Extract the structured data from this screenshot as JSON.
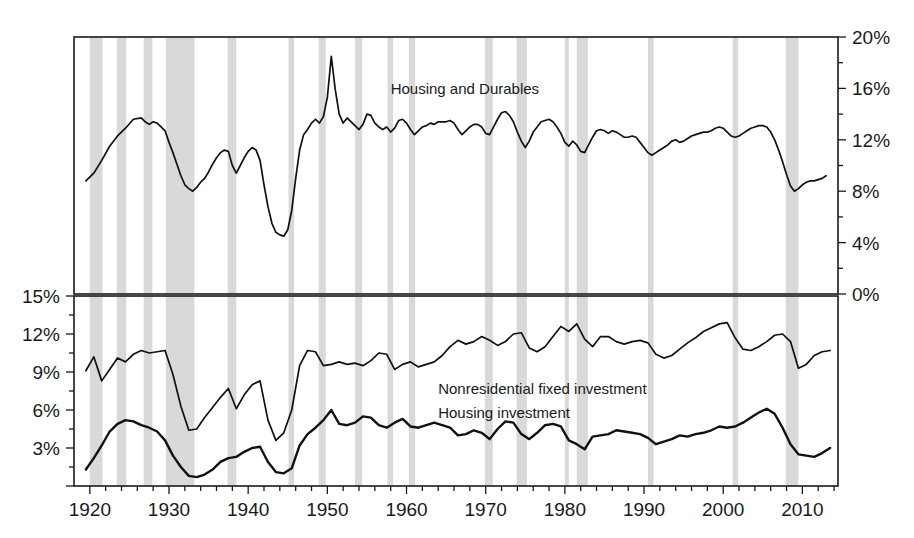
{
  "chart_data": {
    "type": "line",
    "title": "",
    "xlabel": "",
    "panels": [
      {
        "name": "top-panel",
        "ylabel": "",
        "ylim": [
          0,
          20
        ],
        "yticks": [
          0,
          4,
          8,
          12,
          16,
          20
        ],
        "ytick_labels": [
          "0%",
          "4%",
          "8%",
          "12%",
          "16%",
          "20%"
        ],
        "y_axis_side": "right",
        "series": [
          {
            "name": "Housing and Durables",
            "label": "Housing and Durables",
            "label_x": 1958,
            "label_y": 15.6,
            "color": "#111111",
            "x": [
              1919.5,
              1920.5,
              1921.5,
              1922.5,
              1923.5,
              1924.5,
              1925.5,
              1926.5,
              1927.0,
              1927.5,
              1928.0,
              1928.5,
              1929.0,
              1929.5,
              1930.0,
              1930.5,
              1931.0,
              1931.5,
              1932.0,
              1932.5,
              1933.0,
              1933.5,
              1934.0,
              1934.5,
              1935.0,
              1935.5,
              1936.0,
              1936.5,
              1937.0,
              1937.5,
              1938.0,
              1938.5,
              1939.0,
              1939.5,
              1940.0,
              1940.5,
              1941.0,
              1941.5,
              1942.0,
              1942.5,
              1943.0,
              1943.5,
              1944.0,
              1944.5,
              1945.0,
              1945.5,
              1946.0,
              1946.5,
              1947.0,
              1947.5,
              1948.0,
              1948.5,
              1949.0,
              1949.5,
              1950.0,
              1950.5,
              1951.0,
              1951.5,
              1952.0,
              1952.5,
              1953.0,
              1953.5,
              1954.0,
              1954.5,
              1955.0,
              1955.5,
              1956.0,
              1956.5,
              1957.0,
              1957.5,
              1958.0,
              1958.5,
              1959.0,
              1959.5,
              1960.0,
              1960.5,
              1961.0,
              1961.5,
              1962.0,
              1962.5,
              1963.0,
              1963.5,
              1964.0,
              1964.5,
              1965.0,
              1965.5,
              1966.0,
              1966.5,
              1967.0,
              1967.5,
              1968.0,
              1968.5,
              1969.0,
              1969.5,
              1970.0,
              1970.5,
              1971.0,
              1971.5,
              1972.0,
              1972.5,
              1973.0,
              1973.5,
              1974.0,
              1974.5,
              1975.0,
              1975.5,
              1976.0,
              1976.5,
              1977.0,
              1977.5,
              1978.0,
              1978.5,
              1979.0,
              1979.5,
              1980.0,
              1980.5,
              1981.0,
              1981.5,
              1982.0,
              1982.5,
              1983.0,
              1983.5,
              1984.0,
              1984.5,
              1985.0,
              1985.5,
              1986.0,
              1986.5,
              1987.0,
              1987.5,
              1988.0,
              1988.5,
              1989.0,
              1989.5,
              1990.0,
              1990.5,
              1991.0,
              1991.5,
              1992.0,
              1992.5,
              1993.0,
              1993.5,
              1994.0,
              1994.5,
              1995.0,
              1995.5,
              1996.0,
              1996.5,
              1997.0,
              1997.5,
              1998.0,
              1998.5,
              1999.0,
              1999.5,
              2000.0,
              2000.5,
              2001.0,
              2001.5,
              2002.0,
              2002.5,
              2003.0,
              2003.5,
              2004.0,
              2004.5,
              2005.0,
              2005.5,
              2006.0,
              2006.5,
              2007.0,
              2007.5,
              2008.0,
              2008.5,
              2009.0,
              2009.5,
              2010.0,
              2010.5,
              2011.0,
              2011.5,
              2012.0,
              2012.5,
              2013.0,
              2013.5
            ],
            "y": [
              8.8,
              9.4,
              10.4,
              11.5,
              12.3,
              12.9,
              13.6,
              13.7,
              13.4,
              13.2,
              13.4,
              13.3,
              13.0,
              12.7,
              11.8,
              11.0,
              10.1,
              9.2,
              8.5,
              8.2,
              8.0,
              8.3,
              8.7,
              9.0,
              9.5,
              10.1,
              10.6,
              11.0,
              11.2,
              11.1,
              10.0,
              9.4,
              10.0,
              10.6,
              11.1,
              11.4,
              11.2,
              10.4,
              8.5,
              6.8,
              5.5,
              4.8,
              4.6,
              4.5,
              5.0,
              6.5,
              9.0,
              11.2,
              12.4,
              12.8,
              13.3,
              13.6,
              13.3,
              13.8,
              15.3,
              18.5,
              15.9,
              14.0,
              13.3,
              13.7,
              13.4,
              13.1,
              12.8,
              13.2,
              14.0,
              13.9,
              13.3,
              13.0,
              12.8,
              13.0,
              12.6,
              12.9,
              13.5,
              13.6,
              13.3,
              12.8,
              12.4,
              12.7,
              13.0,
              13.1,
              13.3,
              13.2,
              13.4,
              13.4,
              13.4,
              13.5,
              13.3,
              12.8,
              12.4,
              12.7,
              13.0,
              13.2,
              13.2,
              13.0,
              12.5,
              12.4,
              13.0,
              13.6,
              14.1,
              14.2,
              13.9,
              13.4,
              12.6,
              11.9,
              11.4,
              11.9,
              12.6,
              13.0,
              13.4,
              13.5,
              13.6,
              13.4,
              13.0,
              12.5,
              11.8,
              11.5,
              11.9,
              11.6,
              11.1,
              11.0,
              11.6,
              12.2,
              12.7,
              12.8,
              12.7,
              12.5,
              12.7,
              12.6,
              12.4,
              12.2,
              12.2,
              12.3,
              12.2,
              11.8,
              11.4,
              11.0,
              10.8,
              11.0,
              11.2,
              11.4,
              11.6,
              11.9,
              12.0,
              11.8,
              11.9,
              12.1,
              12.3,
              12.4,
              12.5,
              12.6,
              12.6,
              12.7,
              12.9,
              13.0,
              12.9,
              12.6,
              12.3,
              12.2,
              12.3,
              12.5,
              12.7,
              12.9,
              13.0,
              13.1,
              13.1,
              13.0,
              12.6,
              12.0,
              11.2,
              10.3,
              9.3,
              8.4,
              8.0,
              8.2,
              8.5,
              8.7,
              8.8,
              8.8,
              8.9,
              9.0,
              9.2
            ]
          }
        ]
      },
      {
        "name": "bottom-panel",
        "ylabel": "",
        "ylim": [
          0,
          15
        ],
        "yticks": [
          0,
          3,
          6,
          9,
          12,
          15
        ],
        "ytick_labels": [
          "",
          "3%",
          "6%",
          "9%",
          "12%",
          "15%"
        ],
        "y_axis_side": "left",
        "series": [
          {
            "name": "Nonresidential fixed investment",
            "label": "Nonresidential fixed investment",
            "label_x": 1964,
            "label_y": 7.3,
            "color": "#111111",
            "x": [
              1919.5,
              1920.5,
              1921.5,
              1922.5,
              1923.5,
              1924.5,
              1925.5,
              1926.5,
              1927.5,
              1928.5,
              1929.5,
              1930.5,
              1931.5,
              1932.5,
              1933.5,
              1934.5,
              1935.5,
              1936.5,
              1937.5,
              1938.5,
              1939.5,
              1940.5,
              1941.5,
              1942.5,
              1943.5,
              1944.5,
              1945.5,
              1946.5,
              1947.5,
              1948.5,
              1949.5,
              1950.5,
              1951.5,
              1952.5,
              1953.5,
              1954.5,
              1955.5,
              1956.5,
              1957.5,
              1958.5,
              1959.5,
              1960.5,
              1961.5,
              1962.5,
              1963.5,
              1964.5,
              1965.5,
              1966.5,
              1967.5,
              1968.5,
              1969.5,
              1970.5,
              1971.5,
              1972.5,
              1973.5,
              1974.5,
              1975.5,
              1976.5,
              1977.5,
              1978.5,
              1979.5,
              1980.5,
              1981.5,
              1982.5,
              1983.5,
              1984.5,
              1985.5,
              1986.5,
              1987.5,
              1988.5,
              1989.5,
              1990.5,
              1991.5,
              1992.5,
              1993.5,
              1994.5,
              1995.5,
              1996.5,
              1997.5,
              1998.5,
              1999.5,
              2000.5,
              2001.5,
              2002.5,
              2003.5,
              2004.5,
              2005.5,
              2006.5,
              2007.5,
              2008.5,
              2009.5,
              2010.5,
              2011.5,
              2012.5,
              2013.5
            ],
            "y": [
              9.1,
              10.2,
              8.3,
              9.2,
              10.1,
              9.8,
              10.4,
              10.7,
              10.5,
              10.6,
              10.7,
              8.8,
              6.3,
              4.4,
              4.5,
              5.4,
              6.2,
              7.0,
              7.7,
              6.1,
              7.2,
              8.0,
              8.3,
              5.2,
              3.6,
              4.2,
              6.0,
              9.5,
              10.7,
              10.6,
              9.5,
              9.6,
              9.8,
              9.6,
              9.7,
              9.5,
              9.9,
              10.5,
              10.4,
              9.2,
              9.6,
              9.8,
              9.4,
              9.6,
              9.8,
              10.3,
              11.0,
              11.5,
              11.2,
              11.4,
              11.8,
              11.5,
              11.1,
              11.4,
              12.0,
              12.1,
              10.9,
              10.6,
              11.0,
              11.8,
              12.6,
              12.2,
              12.8,
              11.6,
              11.0,
              11.8,
              11.8,
              11.4,
              11.2,
              11.4,
              11.5,
              11.3,
              10.4,
              10.1,
              10.3,
              10.8,
              11.3,
              11.7,
              12.2,
              12.5,
              12.8,
              12.9,
              11.7,
              10.8,
              10.7,
              11.0,
              11.4,
              11.9,
              12.0,
              11.4,
              9.3,
              9.6,
              10.3,
              10.6,
              10.7
            ]
          },
          {
            "name": "Housing investment",
            "label": "Housing investment",
            "label_x": 1964,
            "label_y": 5.4,
            "color": "#111111",
            "x": [
              1919.5,
              1920.5,
              1921.5,
              1922.5,
              1923.5,
              1924.5,
              1925.5,
              1926.5,
              1927.5,
              1928.5,
              1929.5,
              1930.5,
              1931.5,
              1932.5,
              1933.5,
              1934.5,
              1935.5,
              1936.5,
              1937.5,
              1938.5,
              1939.5,
              1940.5,
              1941.5,
              1942.5,
              1943.5,
              1944.5,
              1945.5,
              1946.5,
              1947.5,
              1948.5,
              1949.5,
              1950.5,
              1951.5,
              1952.5,
              1953.5,
              1954.5,
              1955.5,
              1956.5,
              1957.5,
              1958.5,
              1959.5,
              1960.5,
              1961.5,
              1962.5,
              1963.5,
              1964.5,
              1965.5,
              1966.5,
              1967.5,
              1968.5,
              1969.5,
              1970.5,
              1971.5,
              1972.5,
              1973.5,
              1974.5,
              1975.5,
              1976.5,
              1977.5,
              1978.5,
              1979.5,
              1980.5,
              1981.5,
              1982.5,
              1983.5,
              1984.5,
              1985.5,
              1986.5,
              1987.5,
              1988.5,
              1989.5,
              1990.5,
              1991.5,
              1992.5,
              1993.5,
              1994.5,
              1995.5,
              1996.5,
              1997.5,
              1998.5,
              1999.5,
              2000.5,
              2001.5,
              2002.5,
              2003.5,
              2004.5,
              2005.5,
              2006.5,
              2007.5,
              2008.5,
              2009.5,
              2010.5,
              2011.5,
              2012.5,
              2013.5
            ],
            "y": [
              1.3,
              2.2,
              3.2,
              4.3,
              4.9,
              5.2,
              5.1,
              4.8,
              4.6,
              4.3,
              3.6,
              2.4,
              1.5,
              0.8,
              0.7,
              0.9,
              1.3,
              1.9,
              2.2,
              2.3,
              2.7,
              3.0,
              3.1,
              1.9,
              1.1,
              1.0,
              1.4,
              3.2,
              4.1,
              4.6,
              5.2,
              6.0,
              4.9,
              4.8,
              5.0,
              5.5,
              5.4,
              4.8,
              4.6,
              5.0,
              5.3,
              4.7,
              4.6,
              4.8,
              5.0,
              4.8,
              4.6,
              4.0,
              4.1,
              4.4,
              4.2,
              3.7,
              4.5,
              5.1,
              5.0,
              4.1,
              3.7,
              4.2,
              4.8,
              4.9,
              4.7,
              3.6,
              3.3,
              2.9,
              3.9,
              4.0,
              4.1,
              4.4,
              4.3,
              4.2,
              4.1,
              3.8,
              3.3,
              3.5,
              3.7,
              4.0,
              3.9,
              4.1,
              4.2,
              4.4,
              4.7,
              4.6,
              4.7,
              5.0,
              5.4,
              5.8,
              6.1,
              5.7,
              4.6,
              3.3,
              2.5,
              2.4,
              2.3,
              2.6,
              3.0
            ]
          }
        ]
      }
    ],
    "xlim": [
      1918,
      2014.5
    ],
    "xticks": [
      1920,
      1930,
      1940,
      1950,
      1960,
      1970,
      1980,
      1990,
      2000,
      2010
    ],
    "xtick_labels": [
      "1920",
      "1930",
      "1940",
      "1950",
      "1960",
      "1970",
      "1980",
      "1990",
      "2000",
      "2010"
    ],
    "x_minor_tick_step": 2,
    "grid": false,
    "legend": "inline-annotations",
    "recession_bands": [
      {
        "start": 1920.0,
        "end": 1921.6
      },
      {
        "start": 1923.4,
        "end": 1924.6
      },
      {
        "start": 1926.8,
        "end": 1927.9
      },
      {
        "start": 1929.6,
        "end": 1933.2
      },
      {
        "start": 1937.4,
        "end": 1938.5
      },
      {
        "start": 1945.1,
        "end": 1945.8
      },
      {
        "start": 1948.9,
        "end": 1949.8
      },
      {
        "start": 1953.5,
        "end": 1954.4
      },
      {
        "start": 1957.6,
        "end": 1958.3
      },
      {
        "start": 1960.3,
        "end": 1961.1
      },
      {
        "start": 1969.9,
        "end": 1970.9
      },
      {
        "start": 1973.9,
        "end": 1975.2
      },
      {
        "start": 1980.0,
        "end": 1980.5
      },
      {
        "start": 1981.5,
        "end": 1982.9
      },
      {
        "start": 1990.5,
        "end": 1991.2
      },
      {
        "start": 2001.2,
        "end": 2001.9
      },
      {
        "start": 2007.9,
        "end": 2009.5
      }
    ],
    "recession_color": "#d9d9d9",
    "background_color": "#ffffff",
    "line_color": "#111111"
  },
  "figure": {
    "units": "percent of GDP",
    "top_panel_label": "Housing and Durables",
    "bottom_panel_labels": [
      "Nonresidential fixed investment",
      "Housing investment"
    ]
  }
}
